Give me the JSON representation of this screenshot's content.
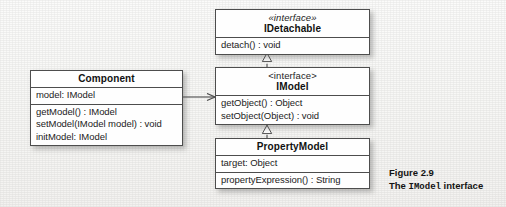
{
  "figure": {
    "caption_line1": "Figure 2.9",
    "caption_line2_prefix": "The ",
    "caption_line2_code": "IModel",
    "caption_line2_suffix": " interface"
  },
  "classes": {
    "idetachable": {
      "stereotype": "«interface»",
      "name": "IDetachable",
      "attributes": [],
      "operations": [
        "detach() : void"
      ]
    },
    "imodel": {
      "stereotype": "<interface>",
      "name": "IModel",
      "attributes": [],
      "operations": [
        "getObject() : Object",
        "setObject(Object) : void"
      ]
    },
    "propertymodel": {
      "stereotype": "",
      "name": "PropertyModel",
      "attributes": [
        "target: Object"
      ],
      "operations": [
        "propertyExpression() : String"
      ]
    },
    "component": {
      "stereotype": "",
      "name": "Component",
      "attributes": [
        "model: IModel"
      ],
      "operations": [
        "getModel() : IModel",
        "setModel(IModel model) : void",
        "initModel: IModel"
      ]
    }
  },
  "relations": [
    {
      "name": "propertymodel-realizes-imodel",
      "type": "realization",
      "from": "PropertyModel",
      "to": "IModel",
      "line": "dashed",
      "arrowhead": "hollow-triangle"
    },
    {
      "name": "imodel-realizes-idetachable",
      "type": "realization",
      "from": "IModel",
      "to": "IDetachable",
      "line": "dashed",
      "arrowhead": "hollow-triangle"
    },
    {
      "name": "component-associates-imodel",
      "type": "association",
      "from": "Component",
      "to": "IModel",
      "line": "solid",
      "arrowhead": "open"
    }
  ],
  "colors": {
    "box_fill": "#fefefe",
    "box_stroke": "#4d4d4d",
    "text": "#1b1b1b",
    "page_bg": "#f7f7f5"
  }
}
